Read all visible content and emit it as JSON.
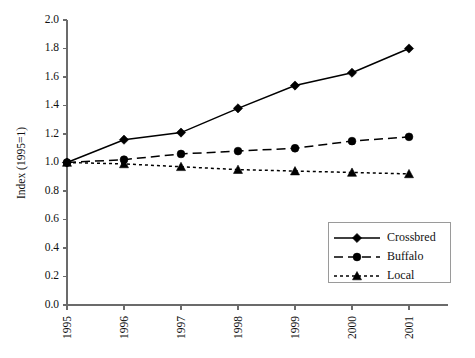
{
  "chart_data": {
    "type": "line",
    "title": "",
    "xlabel": "",
    "ylabel": "Index (1995=1)",
    "categories": [
      "1995",
      "1996",
      "1997",
      "1998",
      "1999",
      "2000",
      "2001"
    ],
    "x": [
      1995,
      1996,
      1997,
      1998,
      1999,
      2000,
      2001
    ],
    "series": [
      {
        "name": "Crossbred",
        "marker": "diamond",
        "linestyle": "solid",
        "color": "#000000",
        "values": [
          1.0,
          1.16,
          1.21,
          1.38,
          1.54,
          1.63,
          1.8
        ]
      },
      {
        "name": "Buffalo",
        "marker": "circle",
        "linestyle": "dashed",
        "color": "#000000",
        "values": [
          1.0,
          1.02,
          1.06,
          1.08,
          1.1,
          1.15,
          1.18
        ]
      },
      {
        "name": "Local",
        "marker": "triangle",
        "linestyle": "dotted",
        "color": "#000000",
        "values": [
          1.0,
          0.99,
          0.97,
          0.95,
          0.94,
          0.93,
          0.92
        ]
      }
    ],
    "ylim": [
      0.0,
      2.0
    ],
    "ytick_labels": [
      "0.0",
      "0.2",
      "0.4",
      "0.6",
      "0.8",
      "1.0",
      "1.2",
      "1.4",
      "1.6",
      "1.8",
      "2.0"
    ],
    "ytick_values": [
      0.0,
      0.2,
      0.4,
      0.6,
      0.8,
      1.0,
      1.2,
      1.4,
      1.6,
      1.8,
      2.0
    ],
    "grid": false,
    "legend_position": "lower-right",
    "legend_entries": [
      "Crossbred",
      "Buffalo",
      "Local"
    ]
  }
}
